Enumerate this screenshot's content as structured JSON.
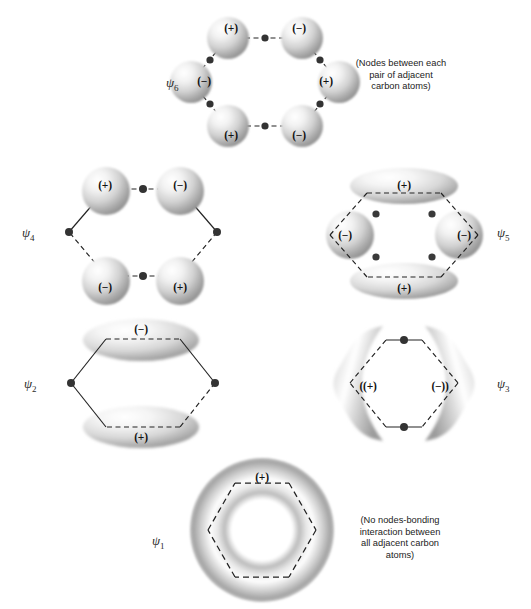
{
  "figure": {
    "background_color": "#ffffff",
    "ink_color": "#1a1a1a"
  },
  "orbitals": [
    {
      "id": "psi6",
      "label": "ψ",
      "subscript": "6",
      "label_x": 166,
      "label_y": 82,
      "shape": "six-spheres-hexagon",
      "center_x": 265,
      "center_y": 82,
      "signs": [
        {
          "text": "(+)",
          "x": 231,
          "y": 28
        },
        {
          "text": "(−)",
          "x": 299,
          "y": 28
        },
        {
          "text": "(−)",
          "x": 204,
          "y": 81
        },
        {
          "text": "(+)",
          "x": 326,
          "y": 81
        },
        {
          "text": "(+)",
          "x": 231,
          "y": 135
        },
        {
          "text": "(−)",
          "x": 299,
          "y": 135
        }
      ],
      "node_count": 6,
      "note": "(Nodes between each\npair of adjacent\ncarbon atoms)",
      "note_x": 340,
      "note_y": 58,
      "note_width": 122
    },
    {
      "id": "psi4",
      "label": "ψ",
      "subscript": "4",
      "label_x": 22,
      "label_y": 232,
      "shape": "four-spheres",
      "center_x": 143,
      "center_y": 232,
      "signs": [
        {
          "text": "(+)",
          "x": 105,
          "y": 185
        },
        {
          "text": "(−)",
          "x": 180,
          "y": 185
        },
        {
          "text": "(−)",
          "x": 105,
          "y": 287
        },
        {
          "text": "(+)",
          "x": 180,
          "y": 287
        }
      ],
      "node_count": 2,
      "note": "",
      "note_x": 0,
      "note_y": 0,
      "note_width": 0
    },
    {
      "id": "psi5",
      "label": "ψ",
      "subscript": "5",
      "label_x": 497,
      "label_y": 232,
      "shape": "two-lobes-two-spheres",
      "center_x": 404,
      "center_y": 232,
      "signs": [
        {
          "text": "(+)",
          "x": 404,
          "y": 185
        },
        {
          "text": "(−)",
          "x": 345,
          "y": 235
        },
        {
          "text": "(−)",
          "x": 464,
          "y": 235
        },
        {
          "text": "(+)",
          "x": 404,
          "y": 288
        }
      ],
      "node_count": 4,
      "note": "",
      "note_x": 0,
      "note_y": 0,
      "note_width": 0
    },
    {
      "id": "psi2",
      "label": "ψ",
      "subscript": "2",
      "label_x": 24,
      "label_y": 383,
      "shape": "two-horizontal-lobes",
      "center_x": 143,
      "center_y": 383,
      "signs": [
        {
          "text": "(−)",
          "x": 141,
          "y": 329
        },
        {
          "text": "(+)",
          "x": 141,
          "y": 437
        }
      ],
      "node_count": 1,
      "note": "",
      "note_x": 0,
      "note_y": 0,
      "note_width": 0
    },
    {
      "id": "psi3",
      "label": "ψ",
      "subscript": "3",
      "label_x": 497,
      "label_y": 383,
      "shape": "two-bent-lobes",
      "center_x": 404,
      "center_y": 383,
      "signs": [
        {
          "text": "((+)",
          "x": 368,
          "y": 386
        },
        {
          "text": "(−))",
          "x": 440,
          "y": 386
        }
      ],
      "node_count": 1,
      "note": "",
      "note_x": 0,
      "note_y": 0,
      "note_width": 0
    },
    {
      "id": "psi1",
      "label": "ψ",
      "subscript": "1",
      "label_x": 152,
      "label_y": 540,
      "shape": "torus",
      "center_x": 262,
      "center_y": 530,
      "signs": [
        {
          "text": "(+)",
          "x": 262,
          "y": 477
        }
      ],
      "node_count": 0,
      "note": "(No nodes-bonding\ninteraction between\nall adjacent carbon\natoms)",
      "note_x": 335,
      "note_y": 515,
      "note_width": 130
    }
  ]
}
